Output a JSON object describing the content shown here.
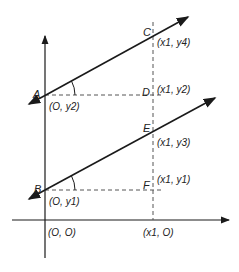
{
  "diagram": {
    "colors": {
      "stroke": "#1a1a1a",
      "dashed": "#555555",
      "background": "#ffffff"
    },
    "points": [
      {
        "name": "A",
        "coord": "(O, y2)"
      },
      {
        "name": "B",
        "coord": "(O, y1)"
      },
      {
        "name": "C",
        "coord": "(x1, y4)"
      },
      {
        "name": "D",
        "coord": "(x1, y2)"
      },
      {
        "name": "E",
        "coord": "(x1, y3)"
      },
      {
        "name": "F",
        "coord": "(x1, y1)"
      }
    ],
    "axis_labels": {
      "origin": "(O, O)",
      "x1": "(x1, O)"
    },
    "labels": {
      "A": "A",
      "B": "B",
      "C": "C",
      "D": "D",
      "E": "E",
      "F": "F"
    }
  }
}
